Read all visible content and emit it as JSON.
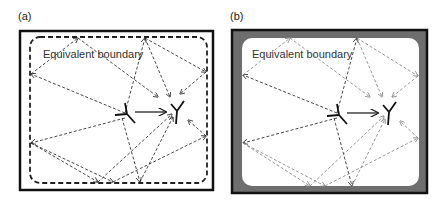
{
  "panels": [
    {
      "id": "a",
      "label": "(a)",
      "boundary_label": "Equivalent boundary",
      "walls": "thin black frame with dashed equivalent boundary"
    },
    {
      "id": "b",
      "label": "(b)",
      "boundary_label": "Equivalent boundary",
      "walls": "thick gray absorbing frame"
    }
  ],
  "colors": {
    "frame": "#111111",
    "absorber": "#6e6e6e",
    "ray_dark": "#333333",
    "ray_light": "#8a8a8a",
    "antenna": "#111111"
  },
  "elements": {
    "transmitter": "Tx antenna (Y-shaped, rotated)",
    "receiver": "Rx antenna (Y-shaped)",
    "direct_path": "solid arrow from Tx to Rx",
    "reflected_paths": "dashed arrows via boundary reflections"
  }
}
